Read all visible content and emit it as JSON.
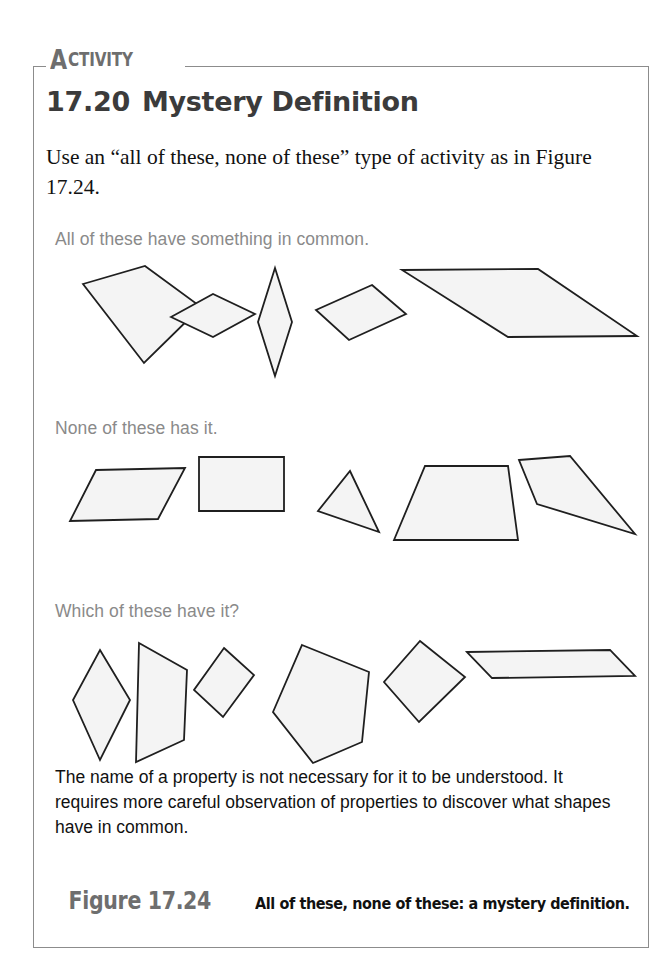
{
  "banner": {
    "label_first_letter": "A",
    "label_rest": "CTIVITY"
  },
  "header": {
    "number": "17.20",
    "title": "Mystery Definition"
  },
  "intro": {
    "text": "Use an “all of these, none of these” type of activity as in Figure 17.24."
  },
  "sections": [
    {
      "label": "All of these have something in common."
    },
    {
      "label": "None of these has it."
    },
    {
      "label": "Which of these have it?"
    }
  ],
  "closing": {
    "text": "The name of a property is not necessary for it to be understood. It requires more careful observation of properties to discover what shapes have in common."
  },
  "caption": {
    "figure_number": "Figure 17.24",
    "figure_text": "All of these, none of these: a mystery definition."
  },
  "colors": {
    "frame_border": "#8c8c8c",
    "banner_gray": "#6e6e6e",
    "title_gray": "#3b3b3b",
    "label_gray": "#8a8a8a",
    "shape_fill": "#f4f4f4",
    "shape_stroke": "#1f1f1f",
    "body_text": "#111111"
  },
  "figure_shapes": {
    "row_1": {
      "caption": "All of these have something in common.",
      "shapes": [
        {
          "name": "tilted-square-rhombus",
          "points": "83,284 145,266 201,307 144,363"
        },
        {
          "name": "wide-rhombus",
          "points": "171,317 213,294 255,314 213,337"
        },
        {
          "name": "tall-narrow-rhombus",
          "points": "275,268 292,322 275,376 258,322"
        },
        {
          "name": "slanted-parallelogram",
          "points": "372,285 406,314 349,340 316,310"
        },
        {
          "name": "large-flat-parallelogram",
          "points": "402,270 538,269 637,336 508,337"
        }
      ]
    },
    "row_2": {
      "caption": "None of these has it.",
      "shapes": [
        {
          "name": "parallelogram",
          "points": "96,470 185,468 158,519 70,521"
        },
        {
          "name": "rectangle",
          "points": "199,457 284,457 284,511 199,511"
        },
        {
          "name": "triangle",
          "points": "350,471 379,532 318,511"
        },
        {
          "name": "trapezoid",
          "points": "425,466 508,466 518,540 394,540"
        },
        {
          "name": "dart-quadrilateral",
          "points": "519,460 570,456 635,534 537,504"
        }
      ]
    },
    "row_3": {
      "caption": "Which of these have it?",
      "shapes": [
        {
          "name": "vertical-rhombus",
          "points": "100,650 130,700 100,760 73,700"
        },
        {
          "name": "tall-trapezoid",
          "points": "139,643 187,670 184,740 136,762"
        },
        {
          "name": "tilted-square",
          "points": "224,648 254,675 223,717 194,690"
        },
        {
          "name": "pentagon",
          "points": "302,645 369,672 362,742 313,763 273,712"
        },
        {
          "name": "tilted-square-2",
          "points": "420,641 465,677 419,722 384,682"
        },
        {
          "name": "thin-parallelogram",
          "points": "467,652 610,650 635,676 492,678"
        }
      ]
    }
  }
}
